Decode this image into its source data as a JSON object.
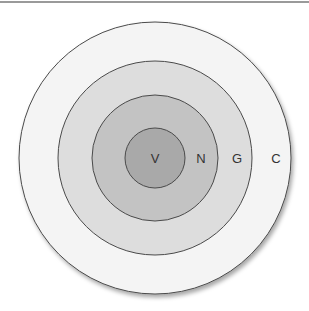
{
  "diagram": {
    "type": "concentric-circles",
    "center": {
      "x": 155,
      "y": 158
    },
    "rings": [
      {
        "label": "C",
        "radius": 136,
        "fill": "#f4f4f4",
        "label_x": 276
      },
      {
        "label": "G",
        "radius": 97,
        "fill": "#dddddd",
        "label_x": 237
      },
      {
        "label": "N",
        "radius": 63,
        "fill": "#c3c3c3",
        "label_x": 201
      },
      {
        "label": "V",
        "radius": 30,
        "fill": "#a9a9a9",
        "label_x": 155
      }
    ],
    "stroke": "#4a4a4a"
  }
}
